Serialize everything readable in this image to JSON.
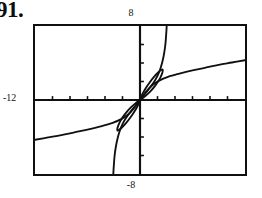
{
  "problem": {
    "number": "91."
  },
  "screen": {
    "top_label": "8",
    "bottom_label": "-8",
    "left_label": "-12",
    "right_label": ""
  },
  "chart_data": {
    "type": "line",
    "title": "",
    "xlabel": "",
    "ylabel": "",
    "xlim": [
      -12,
      12
    ],
    "ylim": [
      -8,
      8
    ],
    "grid": false,
    "legend_position": "none",
    "axis_color": "#101010",
    "curve_color": "#101010",
    "border_color": "#101010",
    "xticks": [
      -10,
      -8,
      -6,
      -4,
      -2,
      2,
      4,
      6,
      8,
      10
    ],
    "yticks": [
      -6,
      -4,
      -2,
      2,
      4,
      6
    ],
    "tick_length": 4,
    "annotations": [
      "odd symmetry about the origin",
      "two closed loops meeting at the origin",
      "steep near-vertical branch through the origin region",
      "shallow branch flattening toward the screen edges"
    ],
    "series": [
      {
        "name": "steep-branch",
        "comment": "near-vertical cubic-like branch passing through origin",
        "x": [
          -3.05,
          -3.0,
          -2.9,
          -2.75,
          -2.55,
          -2.3,
          -2.0,
          -1.6,
          -1.1,
          -0.55,
          0,
          0.55,
          1.1,
          1.6,
          2.0,
          2.3,
          2.55,
          2.75,
          2.9,
          3.0,
          3.05
        ],
        "y": [
          -8.0,
          -7.2,
          -6.0,
          -5.0,
          -4.1,
          -3.3,
          -2.6,
          -1.95,
          -1.3,
          -0.65,
          0,
          0.65,
          1.3,
          1.95,
          2.6,
          3.3,
          4.1,
          5.0,
          6.0,
          7.2,
          8.0
        ]
      },
      {
        "name": "shallow-branch",
        "comment": "slowly rising branch passing through origin, flattening at the edges",
        "x": [
          -12,
          -10.5,
          -9,
          -7.5,
          -6,
          -4.5,
          -3.2,
          -2.2,
          -1.4,
          -0.7,
          0,
          0.7,
          1.4,
          2.2,
          3.2,
          4.5,
          6,
          7.5,
          9,
          10.5,
          12
        ],
        "y": [
          -4.3,
          -4.05,
          -3.8,
          -3.5,
          -3.2,
          -2.85,
          -2.5,
          -2.1,
          -1.6,
          -0.9,
          0,
          0.9,
          1.6,
          2.1,
          2.5,
          2.85,
          3.2,
          3.5,
          3.8,
          4.05,
          4.3
        ]
      },
      {
        "name": "upper-loop",
        "comment": "closed loop in the first quadrant, from origin back to origin",
        "x": [
          0,
          0.5,
          1.1,
          1.7,
          2.2,
          2.5,
          2.6,
          2.5,
          2.1,
          1.6,
          1.1,
          0.6,
          0.25,
          0
        ],
        "y": [
          0,
          0.35,
          0.85,
          1.5,
          2.2,
          2.8,
          3.2,
          3.3,
          3.0,
          2.5,
          1.9,
          1.2,
          0.6,
          0
        ]
      },
      {
        "name": "lower-loop",
        "comment": "closed loop in the third quadrant, mirror of the upper loop",
        "x": [
          0,
          -0.5,
          -1.1,
          -1.7,
          -2.2,
          -2.5,
          -2.6,
          -2.5,
          -2.1,
          -1.6,
          -1.1,
          -0.6,
          -0.25,
          0
        ],
        "y": [
          0,
          -0.35,
          -0.85,
          -1.5,
          -2.2,
          -2.8,
          -3.2,
          -3.3,
          -3.0,
          -2.5,
          -1.9,
          -1.2,
          -0.6,
          0
        ]
      }
    ]
  }
}
